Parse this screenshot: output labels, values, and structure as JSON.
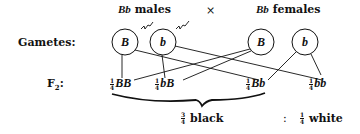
{
  "title_row": {
    "males_genotype": "Bb",
    "males_label": "males",
    "cross_symbol": "×",
    "females_genotype": "Bb",
    "females_label": "females"
  },
  "gametes": {
    "label": "Gametes:",
    "male": [
      "B",
      "b"
    ],
    "female": [
      "B",
      "b"
    ]
  },
  "f2": {
    "label": "F",
    "label_sub": "2",
    "label_suffix": ":",
    "offspring": [
      {
        "num": "1",
        "den": "4",
        "genotype": "BB"
      },
      {
        "num": "1",
        "den": "4",
        "genotype": "bB"
      },
      {
        "num": "1",
        "den": "4",
        "genotype": "Bb"
      },
      {
        "num": "1",
        "den": "4",
        "genotype": "bb"
      }
    ]
  },
  "ratio": {
    "black_num": "3",
    "black_den": "4",
    "black_label": "black",
    "separator": ":",
    "white_num": "1",
    "white_den": "4",
    "white_label": "white"
  },
  "colors": {
    "ink": "#111111",
    "background": "#ffffff"
  }
}
